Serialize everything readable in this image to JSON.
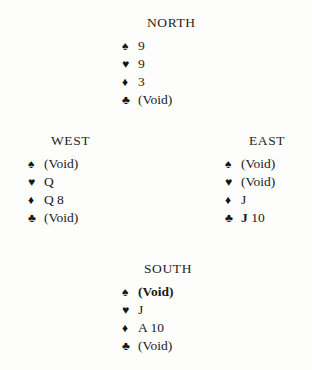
{
  "diagram": {
    "type": "bridge-deal",
    "suit_glyphs": {
      "spade": "♠",
      "heart": "♥",
      "diamond": "♦",
      "club": "♣"
    },
    "suit_color": "#141414",
    "background": "#fdfdfb",
    "hands": {
      "north": {
        "label": "NORTH",
        "suits": [
          {
            "suit": "spade",
            "glyph": "♠",
            "cards": "9",
            "bold": false
          },
          {
            "suit": "heart",
            "glyph": "♥",
            "cards": "9",
            "bold": false
          },
          {
            "suit": "diamond",
            "glyph": "♦",
            "cards": "3",
            "bold": false
          },
          {
            "suit": "club",
            "glyph": "♣",
            "cards": "(Void)",
            "bold": false
          }
        ]
      },
      "west": {
        "label": "WEST",
        "suits": [
          {
            "suit": "spade",
            "glyph": "♠",
            "cards": "(Void)",
            "bold": false
          },
          {
            "suit": "heart",
            "glyph": "♥",
            "cards": "Q",
            "bold": false
          },
          {
            "suit": "diamond",
            "glyph": "♦",
            "cards": "Q 8",
            "bold": false
          },
          {
            "suit": "club",
            "glyph": "♣",
            "cards": "(Void)",
            "bold": false
          }
        ]
      },
      "east": {
        "label": "EAST",
        "suits": [
          {
            "suit": "spade",
            "glyph": "♠",
            "cards": "(Void)",
            "bold": false
          },
          {
            "suit": "heart",
            "glyph": "♥",
            "cards": "(Void)",
            "bold": false
          },
          {
            "suit": "diamond",
            "glyph": "♦",
            "cards": "J",
            "bold": false
          },
          {
            "suit": "club",
            "glyph": "♣",
            "cards": "J 10",
            "bold": false,
            "emph_prefix": "J",
            "emph_rest": " 10"
          }
        ]
      },
      "south": {
        "label": "SOUTH",
        "suits": [
          {
            "suit": "spade",
            "glyph": "♠",
            "cards": "(Void)",
            "bold": true
          },
          {
            "suit": "heart",
            "glyph": "♥",
            "cards": "J",
            "bold": false
          },
          {
            "suit": "diamond",
            "glyph": "♦",
            "cards": "A 10",
            "bold": false
          },
          {
            "suit": "club",
            "glyph": "♣",
            "cards": "(Void)",
            "bold": false
          }
        ]
      }
    }
  }
}
